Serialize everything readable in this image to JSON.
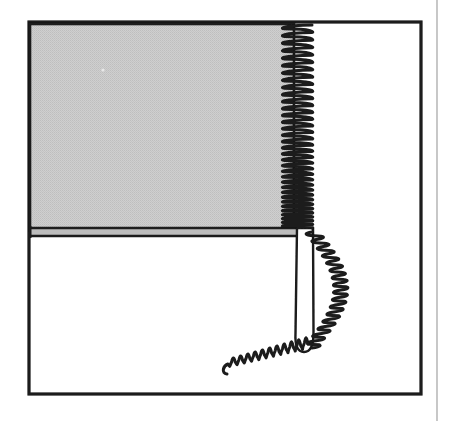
{
  "figure": {
    "domain": "Diagram",
    "title": "Coiled strip peeling from edge of shaded panel",
    "description": "Black-and-white scanned line drawing: a rectangular frame encloses a light-gray shaded panel occupying the upper-left portion. A tightly wound coil runs vertically down the right edge of the shaded panel, then unwinds into a narrow strip that descends and a loose helical tail that arcs out to the right and trails down to the lower left.",
    "media": "scanned line art",
    "background_color": "#ffffff",
    "ink_color": "#1a1a1a",
    "panel_fill_color": "#c9c9c9"
  },
  "canvas": {
    "width": 450,
    "height": 421
  },
  "scan_edge": {
    "name": "page-edge-line",
    "x": 437,
    "y1": 0,
    "y2": 421,
    "color": "#b0b0b0",
    "stroke_width": 1.4
  },
  "frame": {
    "label": "outer-frame",
    "x": 29,
    "y": 22,
    "width": 392,
    "height": 372,
    "stroke_width": 3.2,
    "color": "#1a1a1a",
    "fill": "none"
  },
  "panel": {
    "label": "shaded-panel",
    "x": 30,
    "y": 24,
    "width": 264,
    "height": 206,
    "fill": "#c9c9c9",
    "texture": "halftone-dither",
    "stroke_width": 2.6,
    "stroke_color": "#1a1a1a"
  },
  "panel_base_rule": {
    "label": "double-rule-under-panel",
    "x1": 30,
    "x2": 300,
    "y_top": 228,
    "y_bottom": 236,
    "gap_fill": "#bdbdbd",
    "stroke_width": 2.6,
    "color": "#1a1a1a"
  },
  "left_tick": {
    "label": "left-edge-tick",
    "x": 30,
    "y1": 226,
    "y2": 238,
    "stroke_width": 3.0,
    "color": "#1a1a1a"
  },
  "strip": {
    "label": "unwound-strip",
    "left_x": 297,
    "right_x": 313,
    "top_y": 228,
    "bottom_y": 347,
    "tip_y": 352,
    "fill": "#ffffff",
    "stroke_width": 2.4,
    "color": "#1a1a1a"
  },
  "coil_tight": {
    "label": "tight-coil-along-panel-edge",
    "x_left": 283,
    "x_right": 312,
    "y_start": 25,
    "y_end": 228,
    "turns": 34,
    "stroke_width": 3.0,
    "color": "#1a1a1a",
    "note": "winding becomes progressively denser toward the lower end"
  },
  "coil_arc": {
    "label": "loose-coil-arc",
    "turns": 16,
    "bulge_x_max": 341,
    "y_start": 232,
    "y_end": 348,
    "stroke_width": 3.0,
    "color": "#1a1a1a"
  },
  "coil_tail": {
    "label": "helical-tail",
    "turns": 11,
    "x_start": 308,
    "y_start": 344,
    "x_end": 228,
    "y_end": 364,
    "stroke_width": 3.0,
    "color": "#1a1a1a",
    "direction": "down-left"
  },
  "speck": {
    "label": "scan-speck",
    "x": 103,
    "y": 70,
    "r": 1.6,
    "color": "#e8e8e8"
  }
}
